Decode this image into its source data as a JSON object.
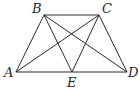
{
  "figure": {
    "type": "trapezoid-with-diagonals",
    "points": {
      "A": {
        "label": "A",
        "x": 16,
        "y": 72
      },
      "B": {
        "label": "B",
        "x": 44,
        "y": 15
      },
      "C": {
        "label": "C",
        "x": 99,
        "y": 15
      },
      "D": {
        "label": "D",
        "x": 127,
        "y": 72
      },
      "E": {
        "label": "E",
        "x": 72,
        "y": 72
      }
    },
    "segments": [
      [
        "A",
        "B"
      ],
      [
        "B",
        "C"
      ],
      [
        "C",
        "D"
      ],
      [
        "A",
        "D"
      ],
      [
        "A",
        "C"
      ],
      [
        "B",
        "D"
      ],
      [
        "B",
        "E"
      ],
      [
        "C",
        "E"
      ]
    ],
    "label_positions": {
      "A": {
        "x": 4,
        "y": 77
      },
      "B": {
        "x": 32,
        "y": 13
      },
      "C": {
        "x": 102,
        "y": 13
      },
      "D": {
        "x": 128,
        "y": 77
      },
      "E": {
        "x": 67,
        "y": 87
      }
    }
  }
}
